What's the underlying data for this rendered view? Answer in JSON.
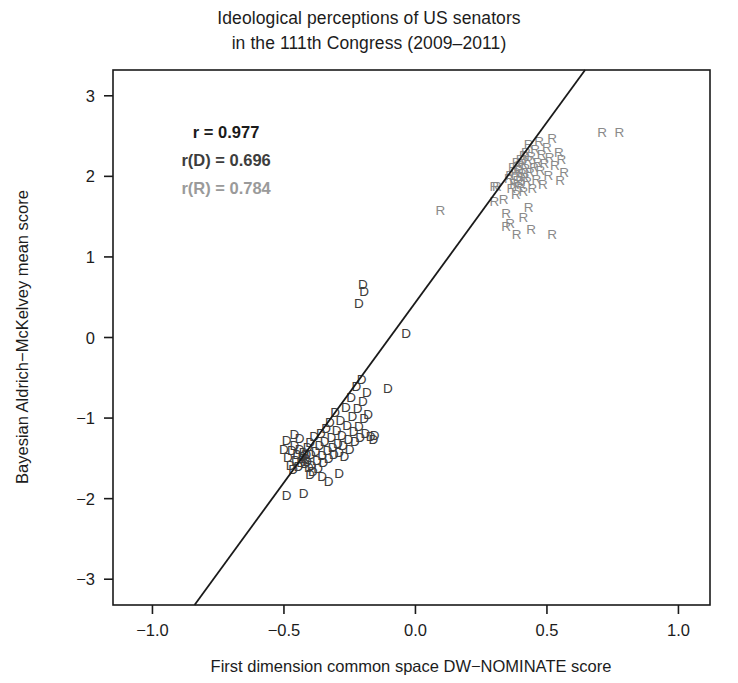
{
  "chart_data": {
    "type": "scatter",
    "title": "Ideological perceptions of US senators\nin the 111th Congress (2009–2011)",
    "title_line1": "Ideological perceptions of US senators",
    "title_line2": "in the 111th Congress (2009–2011)",
    "xlabel": "First dimension common space DW−NOMINATE score",
    "ylabel": "Bayesian Aldrich−McKelvey mean score",
    "xlim": [
      -1.15,
      1.12
    ],
    "ylim": [
      -3.32,
      3.32
    ],
    "xticks": [
      -1.0,
      -0.5,
      0.0,
      0.5,
      1.0
    ],
    "xticklabels": [
      "−1.0",
      "−0.5",
      "0.0",
      "0.5",
      "1.0"
    ],
    "yticks": [
      -3,
      -2,
      -1,
      0,
      1,
      2,
      3
    ],
    "yticklabels": [
      "−3",
      "−2",
      "−1",
      "0",
      "1",
      "2",
      "3"
    ],
    "grid": false,
    "legend": "none",
    "marker_style": "text-letter",
    "colors": {
      "democrat": "#3d3d3d",
      "republican": "#8a8a8a",
      "regression_line": "#1a1a1a",
      "axis": "#1a1a1a",
      "annotation_overall": "#1a1a1a",
      "annotation_democrat": "#3d3d3d",
      "annotation_republican": "#9a9a9a"
    },
    "annotations": [
      {
        "name": "r-overall",
        "text": "r = 0.977",
        "x": -0.72,
        "y": 2.55,
        "color": "#1a1a1a",
        "bold": true
      },
      {
        "name": "r-democrat",
        "text": "r(D) = 0.696",
        "x": -0.72,
        "y": 2.2,
        "color": "#3d3d3d",
        "bold": true
      },
      {
        "name": "r-republican",
        "text": "r(R) = 0.784",
        "x": -0.72,
        "y": 1.85,
        "color": "#9a9a9a",
        "bold": true
      }
    ],
    "regression_line": {
      "x0": -0.84,
      "y0": -3.32,
      "x1": 0.645,
      "y1": 3.32,
      "slope": 4.47,
      "intercept": 0.435
    },
    "series": [
      {
        "name": "Democrats",
        "label": "D",
        "color": "#3d3d3d",
        "points": [
          [
            -0.49,
            -1.27
          ],
          [
            -0.485,
            -1.48
          ],
          [
            -0.475,
            -1.58
          ],
          [
            -0.47,
            -1.4
          ],
          [
            -0.465,
            -1.63
          ],
          [
            -0.46,
            -1.34
          ],
          [
            -0.455,
            -1.52
          ],
          [
            -0.45,
            -1.44
          ],
          [
            -0.445,
            -1.6
          ],
          [
            -0.44,
            -1.38
          ],
          [
            -0.435,
            -1.55
          ],
          [
            -0.43,
            -1.47
          ],
          [
            -0.428,
            -1.5
          ],
          [
            -0.425,
            -1.42
          ],
          [
            -0.42,
            -1.56
          ],
          [
            -0.418,
            -1.49
          ],
          [
            -0.415,
            -1.45
          ],
          [
            -0.412,
            -1.53
          ],
          [
            -0.41,
            -1.36
          ],
          [
            -0.405,
            -1.61
          ],
          [
            -0.4,
            -1.3
          ],
          [
            -0.398,
            -1.44
          ],
          [
            -0.395,
            -1.58
          ],
          [
            -0.39,
            -1.66
          ],
          [
            -0.385,
            -1.22
          ],
          [
            -0.38,
            -1.41
          ],
          [
            -0.375,
            -1.52
          ],
          [
            -0.37,
            -1.62
          ],
          [
            -0.365,
            -1.33
          ],
          [
            -0.36,
            -1.18
          ],
          [
            -0.355,
            -1.46
          ],
          [
            -0.35,
            -1.55
          ],
          [
            -0.345,
            -1.28
          ],
          [
            -0.34,
            -1.12
          ],
          [
            -0.335,
            -1.4
          ],
          [
            -0.33,
            -1.5
          ],
          [
            -0.325,
            -1.05
          ],
          [
            -0.32,
            -1.24
          ],
          [
            -0.315,
            -1.36
          ],
          [
            -0.31,
            -1.44
          ],
          [
            -0.305,
            -0.92
          ],
          [
            -0.3,
            -1.15
          ],
          [
            -0.295,
            -1.31
          ],
          [
            -0.29,
            -1.42
          ],
          [
            -0.285,
            -1.02
          ],
          [
            -0.28,
            -1.21
          ],
          [
            -0.275,
            -1.33
          ],
          [
            -0.27,
            -1.47
          ],
          [
            -0.265,
            -0.86
          ],
          [
            -0.26,
            -1.08
          ],
          [
            -0.255,
            -1.26
          ],
          [
            -0.25,
            -1.38
          ],
          [
            -0.245,
            -0.74
          ],
          [
            -0.24,
            -0.98
          ],
          [
            -0.235,
            -1.16
          ],
          [
            -0.23,
            -1.29
          ],
          [
            -0.225,
            -0.6
          ],
          [
            -0.22,
            -0.88
          ],
          [
            -0.215,
            -1.1
          ],
          [
            -0.21,
            -1.24
          ],
          [
            -0.205,
            -0.52
          ],
          [
            -0.2,
            -0.79
          ],
          [
            -0.195,
            -1.0
          ],
          [
            -0.19,
            -1.19
          ],
          [
            -0.185,
            -0.68
          ],
          [
            -0.18,
            -0.95
          ],
          [
            -0.17,
            -1.22
          ],
          [
            -0.16,
            -1.26
          ],
          [
            -0.215,
            0.43
          ],
          [
            -0.2,
            0.66
          ],
          [
            -0.195,
            0.58
          ],
          [
            -0.49,
            -1.95
          ],
          [
            -0.425,
            -1.93
          ],
          [
            -0.33,
            -1.78
          ],
          [
            -0.5,
            -1.38
          ],
          [
            -0.155,
            -1.21
          ],
          [
            -0.105,
            -0.63
          ],
          [
            -0.035,
            0.05
          ],
          [
            -0.29,
            -1.68
          ],
          [
            -0.355,
            -1.72
          ],
          [
            -0.44,
            -1.25
          ],
          [
            -0.46,
            -1.2
          ],
          [
            -0.4,
            -1.7
          ]
        ]
      },
      {
        "name": "Republicans",
        "label": "R",
        "color": "#8a8a8a",
        "points": [
          [
            0.355,
            1.98
          ],
          [
            0.36,
            2.02
          ],
          [
            0.365,
            1.85
          ],
          [
            0.37,
            2.12
          ],
          [
            0.375,
            1.92
          ],
          [
            0.38,
            2.06
          ],
          [
            0.382,
            1.78
          ],
          [
            0.385,
            2.18
          ],
          [
            0.388,
            1.96
          ],
          [
            0.39,
            2.08
          ],
          [
            0.392,
            1.88
          ],
          [
            0.395,
            2.14
          ],
          [
            0.398,
            2.0
          ],
          [
            0.4,
            2.22
          ],
          [
            0.402,
            1.9
          ],
          [
            0.405,
            2.04
          ],
          [
            0.408,
            2.16
          ],
          [
            0.41,
            1.82
          ],
          [
            0.412,
            2.26
          ],
          [
            0.415,
            1.99
          ],
          [
            0.418,
            2.1
          ],
          [
            0.42,
            2.3
          ],
          [
            0.425,
            1.94
          ],
          [
            0.428,
            2.2
          ],
          [
            0.43,
            2.4
          ],
          [
            0.435,
            2.05
          ],
          [
            0.44,
            2.25
          ],
          [
            0.445,
            1.86
          ],
          [
            0.45,
            2.12
          ],
          [
            0.455,
            2.34
          ],
          [
            0.46,
            1.97
          ],
          [
            0.465,
            2.18
          ],
          [
            0.47,
            2.44
          ],
          [
            0.475,
            2.08
          ],
          [
            0.48,
            2.28
          ],
          [
            0.485,
            1.9
          ],
          [
            0.49,
            2.16
          ],
          [
            0.5,
            2.36
          ],
          [
            0.505,
            2.02
          ],
          [
            0.51,
            2.24
          ],
          [
            0.52,
            2.48
          ],
          [
            0.53,
            2.14
          ],
          [
            0.545,
            2.3
          ],
          [
            0.55,
            1.96
          ],
          [
            0.3,
            1.7
          ],
          [
            0.335,
            1.72
          ],
          [
            0.345,
            1.55
          ],
          [
            0.36,
            1.42
          ],
          [
            0.385,
            1.28
          ],
          [
            0.3,
            1.88
          ],
          [
            0.31,
            1.88
          ],
          [
            0.44,
            1.35
          ],
          [
            0.52,
            1.28
          ],
          [
            0.095,
            1.58
          ],
          [
            0.41,
            1.5
          ],
          [
            0.43,
            1.62
          ],
          [
            0.345,
            1.38
          ],
          [
            0.71,
            2.55
          ],
          [
            0.775,
            2.55
          ],
          [
            0.555,
            2.21
          ],
          [
            0.565,
            2.05
          ]
        ]
      }
    ]
  }
}
